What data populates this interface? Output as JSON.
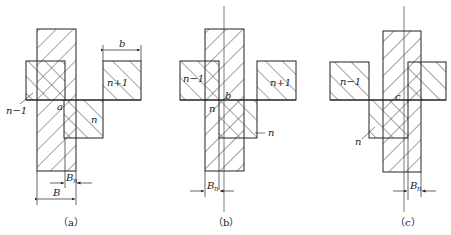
{
  "figure": {
    "panels": [
      {
        "id": "a",
        "caption": "（a）",
        "labels": {
          "prev": "n−1",
          "next": "n+1",
          "current": "n",
          "point": "a",
          "width_b": "b",
          "width_B": "B",
          "offset": "B",
          "offset_sub": "n"
        }
      },
      {
        "id": "b",
        "caption": "（b）",
        "labels": {
          "prev": "n−1",
          "next": "n+1",
          "current_inner": "n",
          "current_pointer": "n",
          "point": "b",
          "offset": "B",
          "offset_sub": "n"
        }
      },
      {
        "id": "c",
        "caption": "（c）",
        "labels": {
          "prev": "n−1",
          "current": "n",
          "point": "c",
          "offset": "B",
          "offset_sub": "n"
        }
      }
    ],
    "colors": {
      "stroke": "#222222",
      "hatch": "#333333",
      "background": "#ffffff"
    }
  }
}
